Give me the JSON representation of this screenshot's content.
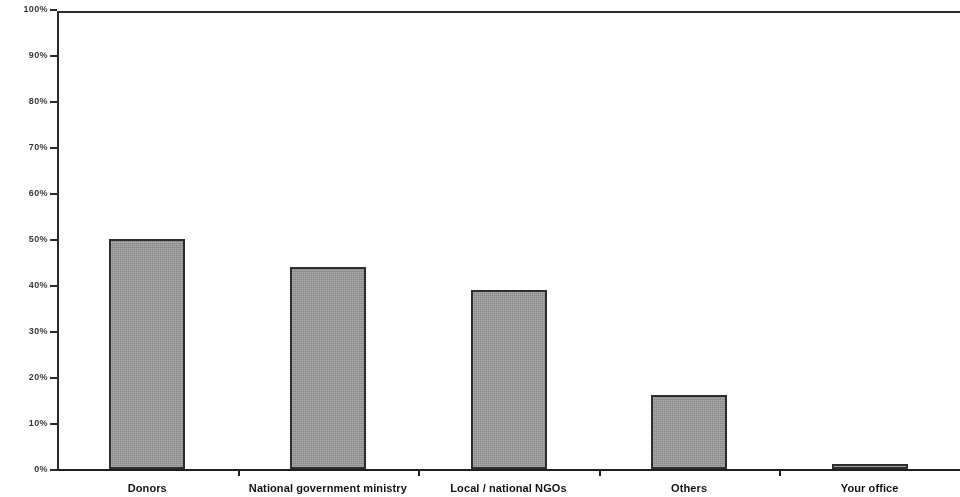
{
  "chart_data": {
    "type": "bar",
    "title": "",
    "subtitle": "",
    "xlabel": "",
    "ylabel": "",
    "categories": [
      "Donors",
      "National government ministry",
      "Local / national NGOs",
      "Others",
      "Your office"
    ],
    "values": [
      50,
      44,
      39,
      16,
      1
    ],
    "value_labels": [
      "50%",
      "44%",
      "39%",
      "16%",
      "1%"
    ],
    "ylim": [
      0,
      100
    ],
    "ytick_values": [
      0,
      10,
      20,
      30,
      40,
      50,
      60,
      70,
      80,
      90,
      100
    ],
    "ytick_labels": [
      "0%",
      "10%",
      "20%",
      "30%",
      "40%",
      "50%",
      "60%",
      "70%",
      "80%",
      "90%",
      "100%"
    ],
    "grid": false,
    "legend": null,
    "legend_position": "none",
    "series": [
      {
        "name": "",
        "values": [
          50,
          44,
          39,
          16,
          1
        ]
      }
    ],
    "colors": {
      "bar_fill": "#9a9a9a",
      "bar_border": "#2e2e2e",
      "axis": "#1f1f1f",
      "tick_label": "#1a1a1a",
      "background": "#ffffff"
    }
  }
}
